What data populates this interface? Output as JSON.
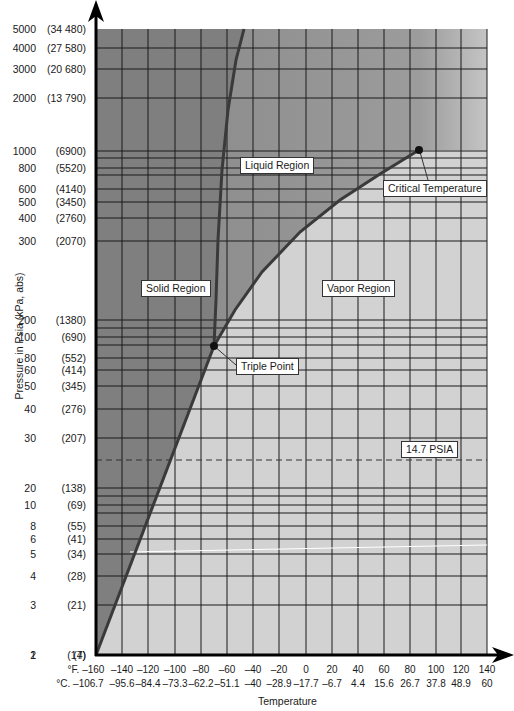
{
  "chart_data": {
    "type": "line",
    "title": "",
    "xlabel": "Temperature",
    "ylabel": "Pressure in Psia (kPa, abs)",
    "x_scale": "linear",
    "y_scale": "log",
    "xlim_F": [
      -160,
      140
    ],
    "ylim_psia": [
      1,
      5000
    ],
    "grid": true,
    "x_ticks_F": [
      "°F. –160",
      "–140",
      "–120",
      "–100",
      "–80",
      "–60",
      "–40",
      "–20",
      "0",
      "20",
      "40",
      "60",
      "80",
      "100",
      "120",
      "140"
    ],
    "x_ticks_C": [
      "°C. –106.7",
      "–95.6",
      "–84.4",
      "–73.3",
      "–62.2",
      "–51.1",
      "–40",
      "–28.9",
      "–17.7",
      "–6.7",
      "4.4",
      "15.6",
      "26.7",
      "37.8",
      "48.9",
      "60"
    ],
    "y_ticks": [
      {
        "psia": "5000",
        "kpa": "(34 480)"
      },
      {
        "psia": "4000",
        "kpa": "(27 580)"
      },
      {
        "psia": "3000",
        "kpa": "(20 680)"
      },
      {
        "psia": "2000",
        "kpa": "(13 790)"
      },
      {
        "psia": "1000",
        "kpa": "(6900)"
      },
      {
        "psia": "800",
        "kpa": "(5520)"
      },
      {
        "psia": "600",
        "kpa": "(4140)"
      },
      {
        "psia": "500",
        "kpa": "(3450)"
      },
      {
        "psia": "400",
        "kpa": "(2760)"
      },
      {
        "psia": "300",
        "kpa": "(2070)"
      },
      {
        "psia": "200",
        "kpa": "(1380)"
      },
      {
        "psia": "100",
        "kpa": "(690)"
      },
      {
        "psia": "80",
        "kpa": "(552)"
      },
      {
        "psia": "60",
        "kpa": "(414)"
      },
      {
        "psia": "50",
        "kpa": "(345)"
      },
      {
        "psia": "40",
        "kpa": "(276)"
      },
      {
        "psia": "30",
        "kpa": "(207)"
      },
      {
        "psia": "20",
        "kpa": "(138)"
      },
      {
        "psia": "10",
        "kpa": "(69)"
      },
      {
        "psia": "8",
        "kpa": "(55)"
      },
      {
        "psia": "6",
        "kpa": "(41)"
      },
      {
        "psia": "5",
        "kpa": "(34)"
      },
      {
        "psia": "4",
        "kpa": "(28)"
      },
      {
        "psia": "3",
        "kpa": "(21)"
      },
      {
        "psia": "2",
        "kpa": "(14)"
      },
      {
        "psia": "1",
        "kpa": "(7)"
      }
    ],
    "series": [
      {
        "name": "Sublimation curve (solid–vapor)",
        "points_F_psia": [
          [
            -160,
            1
          ],
          [
            -140,
            3
          ],
          [
            -120,
            8
          ],
          [
            -100,
            20
          ],
          [
            -80,
            45
          ],
          [
            -69.9,
            75
          ]
        ]
      },
      {
        "name": "Vaporization curve (liquid–vapor)",
        "points_F_psia": [
          [
            -69.9,
            75
          ],
          [
            -60,
            100
          ],
          [
            -40,
            150
          ],
          [
            -20,
            220
          ],
          [
            0,
            305
          ],
          [
            20,
            420
          ],
          [
            40,
            570
          ],
          [
            60,
            750
          ],
          [
            87.9,
            1070
          ]
        ]
      },
      {
        "name": "Melting curve (solid–liquid)",
        "points_F_psia": [
          [
            -69.9,
            75
          ],
          [
            -70,
            200
          ],
          [
            -68,
            700
          ],
          [
            -65,
            2000
          ],
          [
            -57,
            5000
          ]
        ]
      }
    ],
    "annotations": [
      {
        "text": "Liquid Region"
      },
      {
        "text": "Solid Region"
      },
      {
        "text": "Vapor Region"
      },
      {
        "text": "Triple Point",
        "x_F": -69.9,
        "y_psia": 75
      },
      {
        "text": "Critical Temperature",
        "x_F": 87.9,
        "y_psia": 1070
      },
      {
        "text": "14.7 PSIA",
        "y_psia": 14.7,
        "style": "dashed"
      }
    ],
    "colors": {
      "solid": "#7d7d7d",
      "liquid": "#9a9a9a",
      "vapor": "#d0d0d0",
      "curve": "#3a3a3a",
      "grid": "#1a1a1a"
    }
  },
  "labels": {
    "liquid": "Liquid Region",
    "solid": "Solid Region",
    "vapor": "Vapor Region",
    "triple": "Triple Point",
    "critical": "Critical Temperature",
    "atm": "14.7 PSIA",
    "xtitle": "Temperature",
    "ytitle": "Pressure in Psia (kPa, abs)"
  }
}
